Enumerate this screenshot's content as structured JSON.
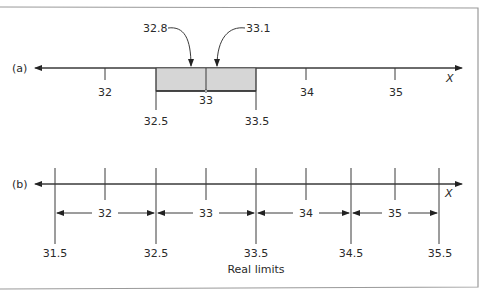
{
  "figure": {
    "panel_a": {
      "label": "(a)",
      "axis_variable": "X",
      "tick_labels": [
        "32",
        "34",
        "35"
      ],
      "center_label": "33",
      "interval_lower": "32.5",
      "interval_upper": "33.5",
      "callouts": [
        "32.8",
        "33.1"
      ],
      "box_fill": "#d6d6d6"
    },
    "panel_b": {
      "label": "(b)",
      "axis_variable": "X",
      "real_limits": [
        "31.5",
        "32.5",
        "33.5",
        "34.5",
        "35.5"
      ],
      "interval_labels": [
        "32",
        "33",
        "34",
        "35"
      ],
      "caption": "Real limits"
    }
  }
}
